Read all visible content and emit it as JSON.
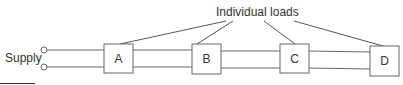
{
  "diagram": {
    "title_label": "Individual loads",
    "supply_label": "Supply",
    "loads": [
      {
        "id": "A",
        "label": "A"
      },
      {
        "id": "B",
        "label": "B"
      },
      {
        "id": "C",
        "label": "C"
      },
      {
        "id": "D",
        "label": "D"
      }
    ],
    "colors": {
      "line": "#555555",
      "text": "#333333",
      "background": "#ffffff"
    }
  }
}
